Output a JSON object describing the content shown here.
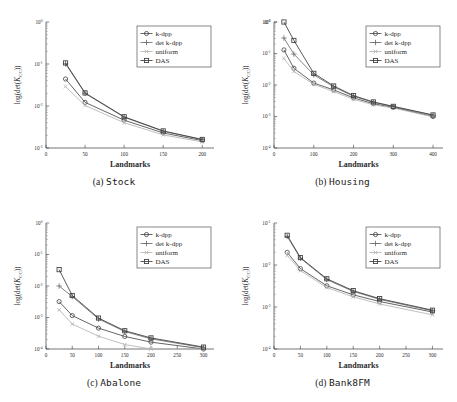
{
  "figure": {
    "axis_x_title": "Landmarks",
    "axis_y_title": "log(det(Kcc))",
    "y_label_parts": {
      "pre": "log(det(",
      "italic": "K",
      "sub": "CC",
      "post": "))"
    },
    "series_names": [
      "k-dpp",
      "det k-dpp",
      "uniform",
      "DAS"
    ],
    "marker_shapes": [
      "circle",
      "plus",
      "x",
      "square"
    ],
    "colors": {
      "k-dpp": "#4a4a4a",
      "det k-dpp": "#6e6e6e",
      "uniform": "#b4b4b4",
      "DAS": "#3c3c3c",
      "axis": "#3a3a3a",
      "background": "#ffffff"
    }
  },
  "chart_data": [
    {
      "type": "line",
      "panel": "a",
      "title": "(a) Stock",
      "caption_prefix": "(a)",
      "caption_name": "Stock",
      "xlabel": "Landmarks",
      "ylabel": "log(det(Kcc))",
      "xlim": [
        0,
        215
      ],
      "xticks": [
        0,
        50,
        100,
        150,
        200
      ],
      "ylim_exp": [
        0,
        -3
      ],
      "yticks_exp": [
        0,
        -1,
        -2,
        -3
      ],
      "ytick_labels": [
        "10^0",
        "10^-1",
        "10^-2",
        "10^-3"
      ],
      "yscale": "log-negative",
      "grid": false,
      "legend_position": "upper-right",
      "x": [
        25,
        50,
        100,
        150,
        200
      ],
      "series": [
        {
          "name": "k-dpp",
          "marker": "circle",
          "values": [
            0.044,
            0.0122,
            0.0046,
            0.00228,
            0.0015
          ]
        },
        {
          "name": "det k-dpp",
          "marker": "plus",
          "values": [
            0.101,
            0.02,
            0.0054,
            0.0025,
            0.00158
          ]
        },
        {
          "name": "uniform",
          "marker": "x",
          "values": [
            0.029,
            0.0103,
            0.004,
            0.00205,
            0.0014
          ]
        },
        {
          "name": "DAS",
          "marker": "square",
          "values": [
            0.106,
            0.0205,
            0.00555,
            0.00255,
            0.0016
          ]
        }
      ]
    },
    {
      "type": "line",
      "panel": "b",
      "title": "(b) Housing",
      "caption_prefix": "(b)",
      "caption_name": "Housing",
      "xlabel": "Landmarks",
      "ylabel": "log(det(Kcc))",
      "xlim": [
        0,
        425
      ],
      "xticks": [
        0,
        100,
        200,
        300,
        400
      ],
      "ylim_exp": [
        -1,
        -4
      ],
      "yticks_exp": [
        -1,
        0,
        -1,
        -2,
        -3,
        -4
      ],
      "ytick_labels": [
        "10^-1",
        "10^0",
        "10^-1",
        "10^-2",
        "10^-3",
        "10^-4"
      ],
      "yscale": "log-negative",
      "grid": false,
      "legend_position": "upper-right",
      "x": [
        25,
        50,
        100,
        150,
        200,
        250,
        300,
        400
      ],
      "series": [
        {
          "name": "k-dpp",
          "marker": "circle",
          "values": [
            0.13,
            0.034,
            0.0115,
            0.007,
            0.0039,
            0.00255,
            0.00195,
            0.001
          ]
        },
        {
          "name": "det k-dpp",
          "marker": "plus",
          "values": [
            0.31,
            0.096,
            0.021,
            0.0088,
            0.0044,
            0.0028,
            0.00205,
            0.00108
          ]
        },
        {
          "name": "uniform",
          "marker": "x",
          "values": [
            0.07,
            0.027,
            0.0105,
            0.0062,
            0.0035,
            0.00235,
            0.00185,
            0.00098
          ]
        },
        {
          "name": "DAS",
          "marker": "square",
          "values": [
            2.0,
            0.26,
            0.0235,
            0.0093,
            0.0046,
            0.0029,
            0.0021,
            0.00112
          ]
        }
      ]
    },
    {
      "type": "line",
      "panel": "c",
      "title": "(c) Abalone",
      "caption_prefix": "(c)",
      "caption_name": "Abalone",
      "xlabel": "Landmarks",
      "ylabel": "log(det(Kcc))",
      "xlim": [
        0,
        320
      ],
      "xticks": [
        0,
        50,
        100,
        150,
        200,
        250,
        300
      ],
      "ylim_exp": [
        0,
        -4
      ],
      "yticks_exp": [
        0,
        -1,
        -2,
        -3,
        -4
      ],
      "ytick_labels": [
        "10^0",
        "10^-1",
        "10^-2",
        "10^-3",
        "10^-4"
      ],
      "yscale": "log-negative",
      "grid": false,
      "legend_position": "upper-right",
      "x": [
        25,
        50,
        100,
        150,
        200,
        300
      ],
      "series": [
        {
          "name": "k-dpp",
          "marker": "circle",
          "values": [
            0.0032,
            0.00115,
            0.00046,
            0.00025,
            0.000165,
            9.8e-05
          ]
        },
        {
          "name": "det k-dpp",
          "marker": "plus",
          "values": [
            0.01,
            0.0046,
            0.0009,
            0.00036,
            0.00021,
            0.00011
          ]
        },
        {
          "name": "uniform",
          "marker": "x",
          "values": [
            0.00175,
            0.00062,
            0.000255,
            0.000138,
            9.4e-05,
            5.2e-05
          ]
        },
        {
          "name": "DAS",
          "marker": "square",
          "values": [
            0.033,
            0.005,
            0.00096,
            0.00038,
            0.000225,
            0.000115
          ]
        }
      ]
    },
    {
      "type": "line",
      "panel": "d",
      "title": "(d) Bank8FM",
      "caption_prefix": "(d)",
      "caption_name": "Bank8FM",
      "xlabel": "Landmarks",
      "ylabel": "log(det(Kcc))",
      "xlim": [
        0,
        320
      ],
      "xticks": [
        0,
        50,
        100,
        150,
        200,
        250,
        300
      ],
      "ylim_exp": [
        -1,
        -4
      ],
      "yticks_exp": [
        -1,
        -2,
        -3,
        -4
      ],
      "ytick_labels": [
        "10^-1",
        "10^-2",
        "10^-3",
        "10^-4"
      ],
      "yscale": "log-negative",
      "grid": false,
      "legend_position": "upper-right",
      "x": [
        25,
        50,
        100,
        150,
        200,
        300
      ],
      "series": [
        {
          "name": "k-dpp",
          "marker": "circle",
          "values": [
            0.02,
            0.0082,
            0.0032,
            0.00195,
            0.00135,
            0.00076
          ]
        },
        {
          "name": "det k-dpp",
          "marker": "plus",
          "values": [
            0.048,
            0.0145,
            0.0045,
            0.00235,
            0.00152,
            0.00081
          ]
        },
        {
          "name": "uniform",
          "marker": "x",
          "values": [
            0.017,
            0.0074,
            0.0029,
            0.00175,
            0.00118,
            0.00065
          ]
        },
        {
          "name": "DAS",
          "marker": "square",
          "values": [
            0.051,
            0.015,
            0.0047,
            0.00245,
            0.00158,
            0.00084
          ]
        }
      ]
    }
  ]
}
